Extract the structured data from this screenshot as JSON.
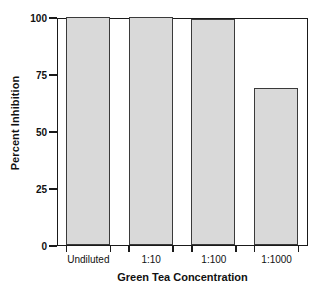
{
  "chart_data": {
    "type": "bar",
    "title": "",
    "xlabel": "Green Tea Concentration",
    "ylabel": "Percent Inhibition",
    "categories": [
      "Undiluted",
      "1:10",
      "1:100",
      "1:1000"
    ],
    "values": [
      100,
      100,
      99,
      69
    ],
    "ylim": [
      0,
      100
    ],
    "yticks": [
      0,
      25,
      50,
      75,
      100
    ],
    "ytick_labels": [
      "0",
      "25",
      "50",
      "75",
      "100"
    ],
    "grid": false,
    "legend": null,
    "bar_fill_color": "#d9d9d9",
    "bar_edge_color": "#3a3a3a",
    "axis_color": "#1a1a1a",
    "background_color": "#ffffff"
  }
}
